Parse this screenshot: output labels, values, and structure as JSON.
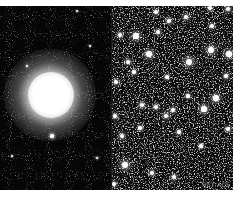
{
  "image": {
    "description": "Two-panel astronomical image: globular cluster (left) and zoomed resolved star field (right)",
    "panels": [
      {
        "name": "cluster-overview",
        "core_center": [
          50,
          87
        ],
        "core_radius": 15,
        "halo_radius": 44
      },
      {
        "name": "resolved-star-field"
      }
    ],
    "watermark": "HST ACS",
    "colors": {
      "background": "#ffffff",
      "sky": "#050505",
      "star": "#ffffff"
    }
  },
  "bright_stars_right": [
    [
      24,
      30,
      2.6
    ],
    [
      46,
      26,
      2.2
    ],
    [
      57,
      15,
      2.0
    ],
    [
      74,
      11,
      2.2
    ],
    [
      98,
      2,
      2.0
    ],
    [
      8,
      29,
      2.0
    ],
    [
      37,
      48,
      2.8
    ],
    [
      77,
      56,
      3.2
    ],
    [
      99,
      44,
      3.2
    ],
    [
      117,
      48,
      2.6
    ],
    [
      16,
      56,
      2.2
    ],
    [
      4,
      76,
      2.2
    ],
    [
      22,
      66,
      1.8
    ],
    [
      55,
      71,
      1.8
    ],
    [
      10,
      130,
      2.2
    ],
    [
      30,
      99,
      2.4
    ],
    [
      44,
      101,
      2.0
    ],
    [
      54,
      110,
      2.4
    ],
    [
      61,
      104,
      2.0
    ],
    [
      44,
      6,
      1.8
    ],
    [
      3,
      110,
      2.0
    ],
    [
      67,
      126,
      1.8
    ],
    [
      92,
      103,
      2.6
    ],
    [
      13,
      159,
      3.2
    ],
    [
      40,
      167,
      2.0
    ],
    [
      62,
      171,
      2.2
    ],
    [
      116,
      3,
      2.0
    ],
    [
      100,
      20,
      1.8
    ],
    [
      28,
      122,
      1.6
    ],
    [
      76,
      90,
      1.6
    ],
    [
      89,
      140,
      1.6
    ],
    [
      104,
      92,
      2.6
    ],
    [
      116,
      123,
      1.8
    ],
    [
      114,
      70,
      2.0
    ],
    [
      2,
      178,
      2.0
    ]
  ],
  "bright_stars_left": [
    [
      52,
      130,
      1.6
    ],
    [
      27,
      60,
      1.2
    ],
    [
      90,
      40,
      1.0
    ],
    [
      97,
      152,
      1.2
    ],
    [
      12,
      150,
      1.0
    ],
    [
      77,
      5,
      1.0
    ]
  ]
}
